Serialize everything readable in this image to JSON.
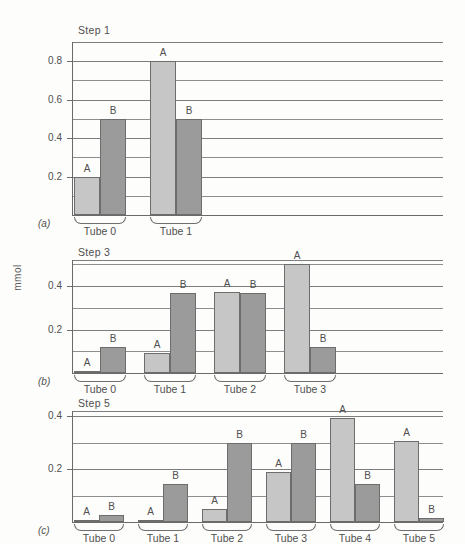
{
  "figure": {
    "ylabel": "mmol",
    "series_labels": [
      "A",
      "B"
    ],
    "colors": {
      "seriesA": "#c6c6c6",
      "seriesB": "#9b9b9b",
      "grid": "#8e8e8e",
      "axis": "#6a6a6a",
      "background": "#fdfdfc"
    }
  },
  "chart_data": [
    {
      "type": "bar",
      "panel": "(a)",
      "title": "Step 1",
      "xlabel": "",
      "ylabel": "mmol",
      "ylim": [
        0,
        0.9
      ],
      "yticks": [
        0.2,
        0.4,
        0.6,
        0.8
      ],
      "ytick_labels": [
        "0.2",
        "0.4",
        "0.6",
        "0.8"
      ],
      "minor_gridlines": [
        0.1,
        0.3,
        0.5,
        0.7
      ],
      "grid": true,
      "categories": [
        "Tube 0",
        "Tube 1"
      ],
      "series": [
        {
          "name": "A",
          "values": [
            0.2,
            0.8
          ]
        },
        {
          "name": "B",
          "values": [
            0.5,
            0.5
          ]
        }
      ]
    },
    {
      "type": "bar",
      "panel": "(b)",
      "title": "Step 3",
      "xlabel": "",
      "ylabel": "mmol",
      "ylim": [
        0,
        0.52
      ],
      "yticks": [
        0.2,
        0.4
      ],
      "ytick_labels": [
        "0.2",
        "0.4"
      ],
      "minor_gridlines": [
        0.1,
        0.3,
        0.5
      ],
      "grid": true,
      "categories": [
        "Tube 0",
        "Tube 1",
        "Tube 2",
        "Tube 3"
      ],
      "series": [
        {
          "name": "A",
          "values": [
            0.005,
            0.09,
            0.375,
            0.5
          ]
        },
        {
          "name": "B",
          "values": [
            0.12,
            0.37,
            0.37,
            0.12
          ]
        }
      ]
    },
    {
      "type": "bar",
      "panel": "(c)",
      "title": "Step 5",
      "xlabel": "",
      "ylabel": "mmol",
      "ylim": [
        0,
        0.42
      ],
      "yticks": [
        0.2,
        0.4
      ],
      "ytick_labels": [
        "0.2",
        "0.4"
      ],
      "minor_gridlines": [
        0.1,
        0.3
      ],
      "grid": true,
      "categories": [
        "Tube 0",
        "Tube 1",
        "Tube 2",
        "Tube 3",
        "Tube 4",
        "Tube 5"
      ],
      "series": [
        {
          "name": "A",
          "values": [
            0.003,
            0.005,
            0.05,
            0.19,
            0.395,
            0.305
          ]
        },
        {
          "name": "B",
          "values": [
            0.025,
            0.145,
            0.3,
            0.3,
            0.145,
            0.015
          ]
        }
      ]
    }
  ]
}
